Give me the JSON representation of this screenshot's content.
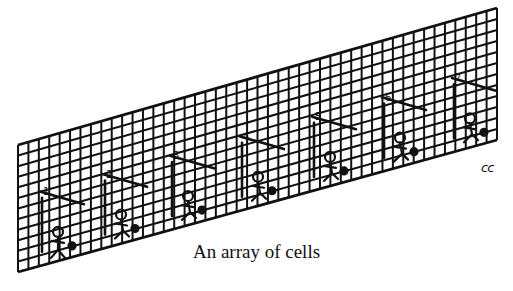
{
  "figure": {
    "caption": "An array of cells",
    "signature": "cc",
    "grid": {
      "top_left": [
        18,
        145
      ],
      "top_right": [
        497,
        8
      ],
      "bottom_left": [
        18,
        272
      ],
      "bottom_right": [
        497,
        140
      ],
      "columns": 46,
      "rows": 12,
      "line_color": "#111111"
    },
    "figures": [
      {
        "label": "1",
        "x": 62
      },
      {
        "label": "2",
        "x": 125
      },
      {
        "label": "3",
        "x": 192
      },
      {
        "label": "4",
        "x": 262
      },
      {
        "label": "5",
        "x": 334
      },
      {
        "label": "6",
        "x": 404
      },
      {
        "label": "7",
        "x": 474
      }
    ]
  }
}
